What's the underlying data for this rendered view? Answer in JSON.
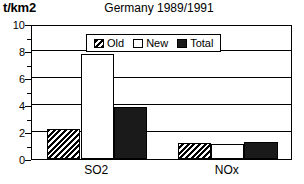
{
  "chart_data": {
    "type": "bar",
    "title": "Germany 1989/1991",
    "xlabel": "",
    "ylabel": "t/km2",
    "categories": [
      "SO2",
      "NOx"
    ],
    "series": [
      {
        "name": "Old",
        "fill": "hatch",
        "values": [
          2.2,
          1.2
        ]
      },
      {
        "name": "New",
        "fill": "white",
        "values": [
          7.75,
          1.1
        ]
      },
      {
        "name": "Total",
        "fill": "solid",
        "values": [
          3.85,
          1.25
        ]
      }
    ],
    "ylim": [
      0,
      10
    ],
    "yticks": [
      0,
      2,
      4,
      6,
      8,
      10
    ],
    "ytick_labels": [
      "0",
      "2",
      "4",
      "6",
      "8",
      "10"
    ],
    "yminor_ticks": [
      1,
      3,
      5,
      7,
      9
    ],
    "grid": true,
    "legend_position": "top-center",
    "colors": {
      "axis": "#000000",
      "grid": "#000000",
      "solid_fill": "#1a1a1a",
      "background": "#ffffff"
    }
  }
}
